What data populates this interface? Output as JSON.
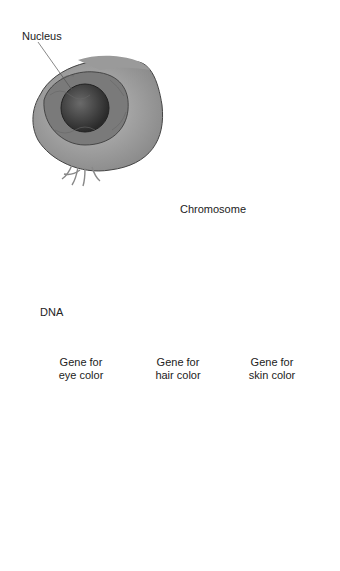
{
  "labels": {
    "nucleus": "Nucleus",
    "chromosome": "Chromosome",
    "dna": "DNA"
  },
  "genes": [
    {
      "line1": "Gene for",
      "line2": "eye color"
    },
    {
      "line1": "Gene for",
      "line2": "hair color"
    },
    {
      "line1": "Gene for",
      "line2": "skin color"
    }
  ],
  "figures": [
    "mother-face",
    "daughter-face"
  ],
  "colors": {
    "hair": "#5a5a5a",
    "skin": "#cfcfcf",
    "line": "#8a8a8a",
    "outline": "#222222",
    "chromosome": "#4a4a4a"
  }
}
